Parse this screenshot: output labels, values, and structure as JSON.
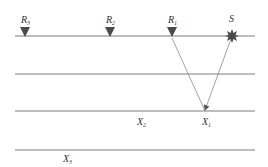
{
  "diagram": {
    "type": "seismic-ray-path",
    "colors": {
      "layer_line": "#7a7a7a",
      "ray": "#8a8a8a",
      "marker": "#4a4a4a",
      "text": "#333333",
      "background": "#ffffff"
    },
    "layers": [
      {
        "y": 36,
        "x1": 15,
        "x2": 255
      },
      {
        "y": 74,
        "x1": 15,
        "x2": 255
      },
      {
        "y": 111,
        "x1": 15,
        "x2": 255
      },
      {
        "y": 150,
        "x1": 15,
        "x2": 255
      }
    ],
    "receivers": [
      {
        "label": "R",
        "sub": "3",
        "x": 25,
        "y": 36
      },
      {
        "label": "R",
        "sub": "2",
        "x": 110,
        "y": 36
      },
      {
        "label": "R",
        "sub": "1",
        "x": 172,
        "y": 36
      }
    ],
    "source": {
      "label": "S",
      "x": 232,
      "y": 36
    },
    "reflection_points": [
      {
        "label": "X",
        "sub": "1",
        "x": 205,
        "y": 111,
        "label_x": 202,
        "label_y": 125
      },
      {
        "label": "X",
        "sub": "2",
        "x": 142,
        "y": 111,
        "label_x": 137,
        "label_y": 125
      },
      {
        "label": "X",
        "sub": "3",
        "x": 66,
        "y": 150,
        "label_x": 63,
        "label_y": 162
      }
    ],
    "rays": [
      {
        "from": "S",
        "to": "X1",
        "x1": 232,
        "y1": 36,
        "x2": 205,
        "y2": 111
      },
      {
        "from": "X1",
        "to": "R1",
        "x1": 205,
        "y1": 111,
        "x2": 172,
        "y2": 36
      }
    ]
  }
}
